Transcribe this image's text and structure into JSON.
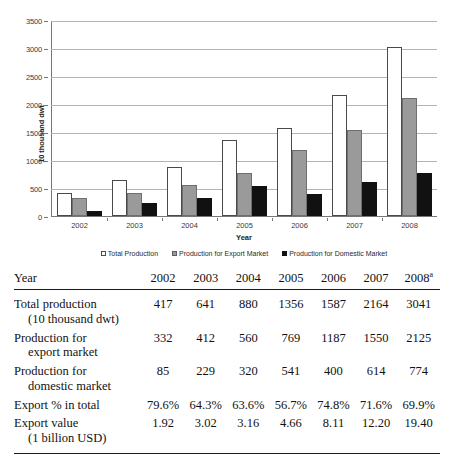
{
  "chart_data": {
    "type": "bar",
    "title": "",
    "xlabel": "Year",
    "ylabel": "10 thousand dwt",
    "categories": [
      "2002",
      "2003",
      "2004",
      "2005",
      "2006",
      "2007",
      "2008"
    ],
    "ylim": [
      0,
      3500
    ],
    "yticks": [
      0,
      500,
      1000,
      1500,
      2000,
      2500,
      3000,
      3500
    ],
    "grid": true,
    "legend_position": "bottom",
    "series": [
      {
        "name": "Total Production",
        "color": "#ffffff",
        "values": [
          417,
          641,
          880,
          1356,
          1587,
          2164,
          3041
        ]
      },
      {
        "name": "Production for Export Market",
        "color": "#9a9a9a",
        "values": [
          332,
          412,
          560,
          769,
          1187,
          1550,
          2125
        ]
      },
      {
        "name": "Production for Domestic Market",
        "color": "#111111",
        "values": [
          85,
          229,
          320,
          541,
          400,
          614,
          774
        ]
      }
    ]
  },
  "table": {
    "header": {
      "label": "Year",
      "columns": [
        "2002",
        "2003",
        "2004",
        "2005",
        "2006",
        "2007",
        "2008"
      ],
      "last_column_footnote": "a"
    },
    "rows": [
      {
        "label_line1": "Total production",
        "label_line2": "(10 thousand dwt)",
        "values": [
          "417",
          "641",
          "880",
          "1356",
          "1587",
          "2164",
          "3041"
        ]
      },
      {
        "label_line1": "Production for",
        "label_line2": "export market",
        "values": [
          "332",
          "412",
          "560",
          "769",
          "1187",
          "1550",
          "2125"
        ]
      },
      {
        "label_line1": "Production for",
        "label_line2": "domestic market",
        "values": [
          "85",
          "229",
          "320",
          "541",
          "400",
          "614",
          "774"
        ]
      },
      {
        "label_line1": "Export % in total",
        "label_line2": "",
        "values": [
          "79.6%",
          "64.3%",
          "63.6%",
          "56.7%",
          "74.8%",
          "71.6%",
          "69.9%"
        ]
      },
      {
        "label_line1": "Export value",
        "label_line2": "(1 billion USD)",
        "values": [
          "1.92",
          "3.02",
          "3.16",
          "4.66",
          "8.11",
          "12.20",
          "19.40"
        ]
      }
    ]
  }
}
